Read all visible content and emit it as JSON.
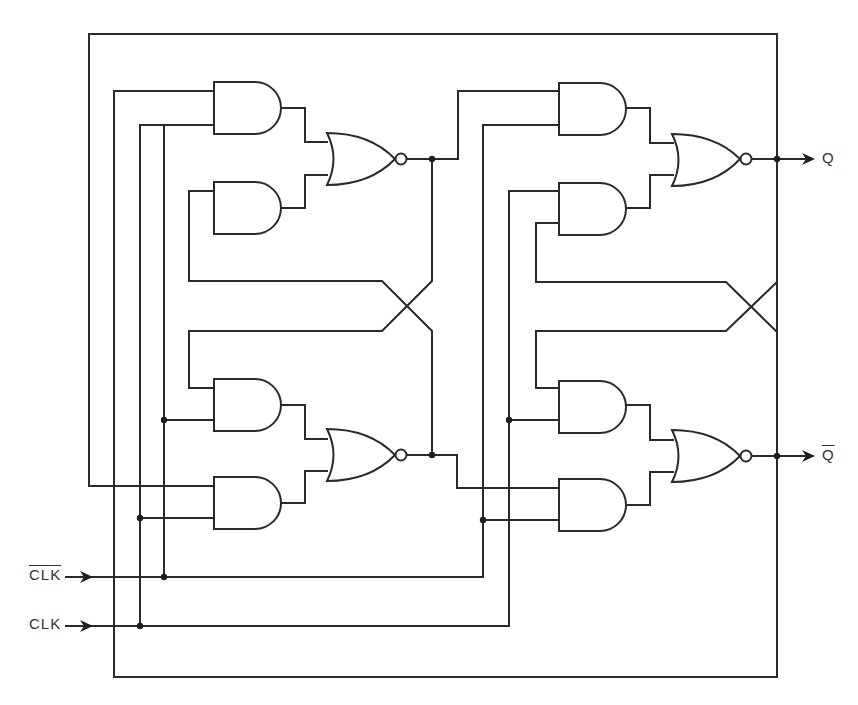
{
  "diagram": {
    "type": "logic-circuit",
    "inputs": [
      {
        "id": "clk_bar",
        "label": "CLK",
        "overline": true
      },
      {
        "id": "clk",
        "label": "CLK",
        "overline": false
      }
    ],
    "outputs": [
      {
        "id": "q",
        "label": "Q",
        "overline": false
      },
      {
        "id": "q_bar",
        "label": "Q",
        "overline": true
      }
    ],
    "stages": [
      {
        "name": "master",
        "gates": [
          "AND",
          "AND",
          "NOR",
          "AND",
          "AND",
          "NOR"
        ]
      },
      {
        "name": "slave",
        "gates": [
          "AND",
          "AND",
          "NOR",
          "AND",
          "AND",
          "NOR"
        ]
      }
    ],
    "colors": {
      "line": "#2a2a2a",
      "background": "#ffffff",
      "text": "#333333"
    }
  }
}
